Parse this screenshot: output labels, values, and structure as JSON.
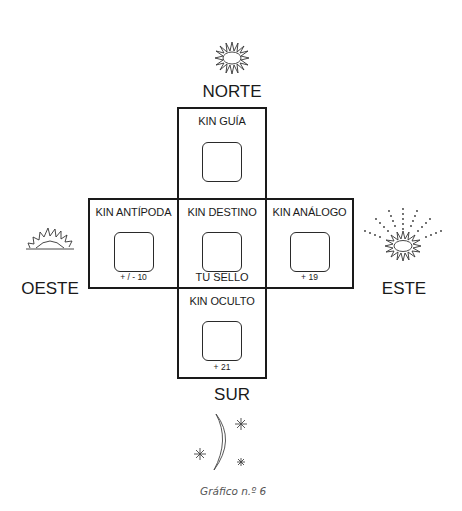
{
  "directions": {
    "north": "NORTE",
    "south": "SUR",
    "west": "OESTE",
    "east": "ESTE"
  },
  "cells": {
    "guide": {
      "title": "KIN GUÍA",
      "footer": ""
    },
    "antipode": {
      "title": "KIN ANTÍPODA",
      "footer": "+ / - 10"
    },
    "destiny": {
      "title": "KIN DESTINO",
      "footer": "TU SELLO"
    },
    "analog": {
      "title": "KIN ANÁLOGO",
      "footer": "+ 19"
    },
    "occult": {
      "title": "KIN OCULTO",
      "footer": "+ 21"
    }
  },
  "icons": {
    "north": "sun-icon",
    "west": "rising-sun-icon",
    "east": "radiant-sun-icon",
    "south": "moon-stars-icon"
  },
  "caption": "Gráfico n.º 6"
}
